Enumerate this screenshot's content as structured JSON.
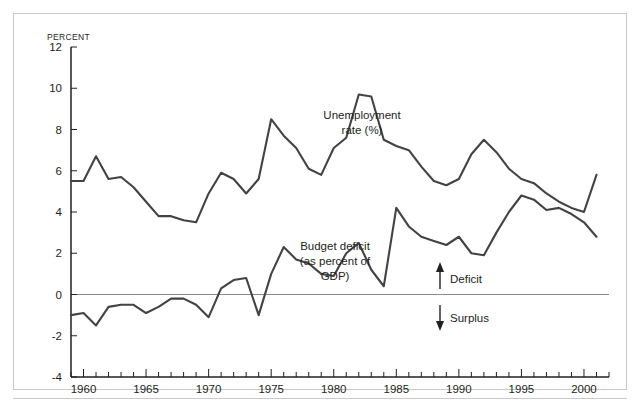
{
  "figure": {
    "y_axis_unit_label": "PERCENT"
  },
  "labels": {
    "unemployment_line1": "Unemployment",
    "unemployment_line2": "rate (%)",
    "deficit_line1": "Budget deficit",
    "deficit_line2": "(as percent of",
    "deficit_line3": "GDP)",
    "deficit_arrow": "Deficit",
    "surplus_arrow": "Surplus"
  },
  "colors": {
    "line": "#444243",
    "axis": "#231f20",
    "zero_line": "#8a8a8a",
    "frame": "#c9c9c9",
    "background": "#ffffff"
  },
  "chart_data": {
    "type": "line",
    "title": "",
    "xlabel": "",
    "ylabel": "PERCENT",
    "xlim": [
      1959,
      2002
    ],
    "ylim": [
      -4,
      12
    ],
    "yticks": [
      -4,
      -2,
      0,
      2,
      4,
      6,
      8,
      10,
      12
    ],
    "ytick_labels": [
      "-4",
      "-2",
      "0",
      "2",
      "4",
      "6",
      "8",
      "10",
      "12"
    ],
    "xticks_major": [
      1960,
      1965,
      1970,
      1975,
      1980,
      1985,
      1990,
      1995,
      2000
    ],
    "xtick_labels": [
      "1960",
      "1965",
      "1970",
      "1975",
      "1980",
      "1985",
      "1990",
      "1995",
      "2000"
    ],
    "xticks_minor_step": 1,
    "grid": false,
    "legend": "inline-annotation",
    "zero_reference_line": 0,
    "x": [
      1959,
      1960,
      1961,
      1962,
      1963,
      1964,
      1965,
      1966,
      1967,
      1968,
      1969,
      1970,
      1971,
      1972,
      1973,
      1974,
      1975,
      1976,
      1977,
      1978,
      1979,
      1980,
      1981,
      1982,
      1983,
      1984,
      1985,
      1986,
      1987,
      1988,
      1989,
      1990,
      1991,
      1992,
      1993,
      1994,
      1995,
      1996,
      1997,
      1998,
      1999,
      2000,
      2001
    ],
    "series": [
      {
        "name": "Unemployment rate (%)",
        "values": [
          5.5,
          5.5,
          6.7,
          5.6,
          5.7,
          5.2,
          4.5,
          3.8,
          3.8,
          3.6,
          3.5,
          4.9,
          5.9,
          5.6,
          4.9,
          5.6,
          8.5,
          7.7,
          7.1,
          6.1,
          5.8,
          7.1,
          7.6,
          9.7,
          9.6,
          7.5,
          7.2,
          7.0,
          6.2,
          5.5,
          5.3,
          5.6,
          6.8,
          7.5,
          6.9,
          6.1,
          5.6,
          5.4,
          4.9,
          4.5,
          4.2,
          4.0,
          5.8
        ]
      },
      {
        "name": "Budget deficit (as percent of GDP)",
        "values": [
          -1.0,
          -0.9,
          -1.5,
          -0.6,
          -0.5,
          -0.5,
          -0.9,
          -0.6,
          -0.2,
          -0.2,
          -0.5,
          -1.1,
          0.3,
          0.7,
          0.8,
          -1.0,
          1.0,
          2.3,
          1.7,
          1.5,
          1.0,
          0.9,
          2.0,
          2.5,
          1.2,
          0.4,
          4.2,
          3.3,
          2.8,
          2.6,
          2.4,
          2.8,
          2.0,
          1.9,
          3.0,
          4.0,
          4.8,
          4.6,
          4.1,
          4.2,
          3.9,
          3.5,
          2.8
        ]
      }
    ],
    "series_corrected_note": "",
    "annotations": [
      {
        "text": "Deficit",
        "direction": "up",
        "near_value": 1.2
      },
      {
        "text": "Surplus",
        "direction": "down",
        "near_value": -1.1
      }
    ]
  }
}
